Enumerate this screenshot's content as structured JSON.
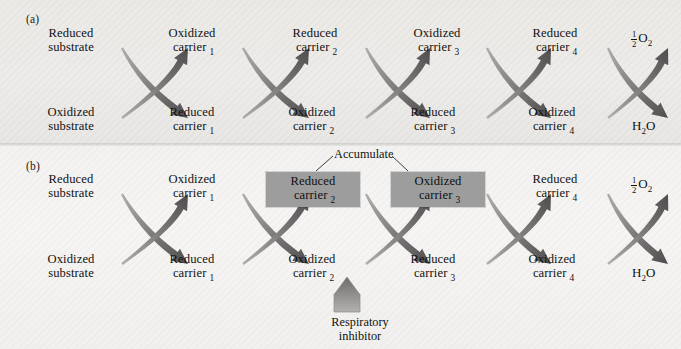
{
  "figure": {
    "panels": [
      {
        "id": "a",
        "label": "(a)"
      },
      {
        "id": "b",
        "label": "(b)"
      }
    ]
  },
  "labels": {
    "reduced_substrate": "Reduced\nsubstrate",
    "oxidized_substrate": "Oxidized\nsubstrate",
    "reduced_carrier": "Reduced",
    "oxidized_carrier": "Oxidized",
    "carrier_word": "carrier",
    "accumulate": "Accumulate",
    "respiratory_inhibitor": "Respiratory\ninhibitor",
    "oxygen_half": "O",
    "oxygen_sub": "2",
    "fraction_num": "1",
    "fraction_den": "2",
    "water": "H",
    "water_sub": "2",
    "water_tail": "O"
  },
  "panel_a": {
    "panel_label": "(a)",
    "top_row": [
      {
        "name": "reduced-substrate",
        "line1": "Reduced",
        "line2": "substrate",
        "sub": ""
      },
      {
        "name": "oxidized-carrier-1",
        "line1": "Oxidized",
        "line2": "carrier",
        "sub": "1"
      },
      {
        "name": "reduced-carrier-2",
        "line1": "Reduced",
        "line2": "carrier",
        "sub": "2"
      },
      {
        "name": "oxidized-carrier-3",
        "line1": "Oxidized",
        "line2": "carrier",
        "sub": "3"
      },
      {
        "name": "reduced-carrier-4",
        "line1": "Reduced",
        "line2": "carrier",
        "sub": "4"
      }
    ],
    "bottom_row": [
      {
        "name": "oxidized-substrate",
        "line1": "Oxidized",
        "line2": "substrate",
        "sub": ""
      },
      {
        "name": "reduced-carrier-1",
        "line1": "Reduced",
        "line2": "carrier",
        "sub": "1"
      },
      {
        "name": "oxidized-carrier-2",
        "line1": "Oxidized",
        "line2": "carrier",
        "sub": "2"
      },
      {
        "name": "reduced-carrier-3",
        "line1": "Reduced",
        "line2": "carrier",
        "sub": "3"
      },
      {
        "name": "oxidized-carrier-4",
        "line1": "Oxidized",
        "line2": "carrier",
        "sub": "4"
      }
    ],
    "terminal_top": "1/2 O2",
    "terminal_bottom": "H2O"
  },
  "panel_b": {
    "panel_label": "(b)",
    "top_row": [
      {
        "name": "reduced-substrate",
        "line1": "Reduced",
        "line2": "substrate",
        "sub": "",
        "highlight": false
      },
      {
        "name": "oxidized-carrier-1",
        "line1": "Oxidized",
        "line2": "carrier",
        "sub": "1",
        "highlight": false
      },
      {
        "name": "reduced-carrier-2",
        "line1": "Reduced",
        "line2": "carrier",
        "sub": "2",
        "highlight": true
      },
      {
        "name": "oxidized-carrier-3",
        "line1": "Oxidized",
        "line2": "carrier",
        "sub": "3",
        "highlight": true
      },
      {
        "name": "reduced-carrier-4",
        "line1": "Reduced",
        "line2": "carrier",
        "sub": "4",
        "highlight": false
      }
    ],
    "bottom_row": [
      {
        "name": "oxidized-substrate",
        "line1": "Oxidized",
        "line2": "substrate",
        "sub": "",
        "highlight": false
      },
      {
        "name": "reduced-carrier-1",
        "line1": "Reduced",
        "line2": "carrier",
        "sub": "1",
        "highlight": false
      },
      {
        "name": "oxidized-carrier-2",
        "line1": "Oxidized",
        "line2": "carrier",
        "sub": "2",
        "highlight": false
      },
      {
        "name": "reduced-carrier-3",
        "line1": "Reduced",
        "line2": "carrier",
        "sub": "3",
        "highlight": false
      },
      {
        "name": "oxidized-carrier-4",
        "line1": "Oxidized",
        "line2": "carrier",
        "sub": "4",
        "highlight": false
      }
    ],
    "terminal_top": "1/2 O2",
    "terminal_bottom": "H2O",
    "annotation_accumulate": "Accumulate",
    "annotation_inhibitor_line1": "Respiratory",
    "annotation_inhibitor_line2": "inhibitor"
  },
  "colors": {
    "arrow_dark": "#555152",
    "arrow_light": "#a9a6a6",
    "highlight_box": "#9d9d9d",
    "panel_a_bg": "#ecebe7",
    "panel_b_bg": "#f4f3f1",
    "text": "#111111"
  }
}
